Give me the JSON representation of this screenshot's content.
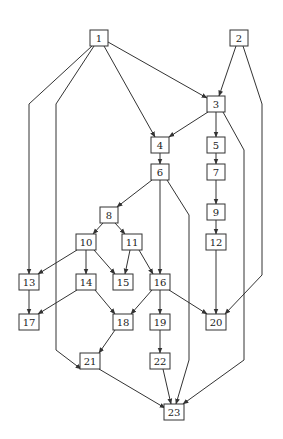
{
  "diagram": {
    "type": "directed-acyclic-graph",
    "colors": {
      "line": "#333333",
      "node_fill": "#ffffff",
      "text": "#222222",
      "background": "#ffffff"
    },
    "node_size": {
      "w": 18,
      "h": 16
    },
    "nodes": [
      {
        "id": "1",
        "label": "1",
        "x": 99,
        "y": 38
      },
      {
        "id": "2",
        "label": "2",
        "x": 239,
        "y": 38
      },
      {
        "id": "3",
        "label": "3",
        "x": 216,
        "y": 104
      },
      {
        "id": "4",
        "label": "4",
        "x": 160,
        "y": 145
      },
      {
        "id": "5",
        "label": "5",
        "x": 216,
        "y": 145
      },
      {
        "id": "6",
        "label": "6",
        "x": 160,
        "y": 172
      },
      {
        "id": "7",
        "label": "7",
        "x": 216,
        "y": 172
      },
      {
        "id": "8",
        "label": "8",
        "x": 109,
        "y": 215
      },
      {
        "id": "9",
        "label": "9",
        "x": 216,
        "y": 212
      },
      {
        "id": "10",
        "label": "10",
        "x": 86,
        "y": 242
      },
      {
        "id": "11",
        "label": "11",
        "x": 132,
        "y": 242
      },
      {
        "id": "12",
        "label": "12",
        "x": 216,
        "y": 242
      },
      {
        "id": "13",
        "label": "13",
        "x": 29,
        "y": 282
      },
      {
        "id": "14",
        "label": "14",
        "x": 86,
        "y": 282
      },
      {
        "id": "15",
        "label": "15",
        "x": 123,
        "y": 282
      },
      {
        "id": "16",
        "label": "16",
        "x": 160,
        "y": 282
      },
      {
        "id": "17",
        "label": "17",
        "x": 29,
        "y": 322
      },
      {
        "id": "18",
        "label": "18",
        "x": 123,
        "y": 322
      },
      {
        "id": "19",
        "label": "19",
        "x": 160,
        "y": 322
      },
      {
        "id": "20",
        "label": "20",
        "x": 216,
        "y": 322
      },
      {
        "id": "21",
        "label": "21",
        "x": 90,
        "y": 361
      },
      {
        "id": "22",
        "label": "22",
        "x": 160,
        "y": 361
      },
      {
        "id": "23",
        "label": "23",
        "x": 174,
        "y": 412
      }
    ],
    "edges": [
      {
        "from": "1",
        "to": "13",
        "points": [
          [
            92,
            46
          ],
          [
            29,
            104
          ],
          [
            29,
            274
          ]
        ]
      },
      {
        "from": "1",
        "to": "21",
        "points": [
          [
            94,
            46
          ],
          [
            56,
            104
          ],
          [
            56,
            350
          ],
          [
            81,
            369
          ]
        ]
      },
      {
        "from": "1",
        "to": "4",
        "points": [
          [
            104,
            46
          ],
          [
            155,
            137
          ]
        ]
      },
      {
        "from": "1",
        "to": "3",
        "points": [
          [
            108,
            42
          ],
          [
            207,
            98
          ]
        ]
      },
      {
        "from": "2",
        "to": "3",
        "points": [
          [
            236,
            46
          ],
          [
            219,
            96
          ]
        ]
      },
      {
        "from": "2",
        "to": "20",
        "points": [
          [
            243,
            46
          ],
          [
            262,
            104
          ],
          [
            262,
            275
          ],
          [
            225,
            314
          ]
        ]
      },
      {
        "from": "3",
        "to": "4",
        "points": [
          [
            208,
            112
          ],
          [
            169,
            137
          ]
        ]
      },
      {
        "from": "3",
        "to": "5",
        "points": [
          [
            216,
            112
          ],
          [
            216,
            137
          ]
        ]
      },
      {
        "from": "3",
        "to": "23",
        "points": [
          [
            223,
            112
          ],
          [
            244,
            150
          ],
          [
            244,
            360
          ],
          [
            183,
            404
          ]
        ]
      },
      {
        "from": "4",
        "to": "6",
        "points": [
          [
            160,
            153
          ],
          [
            160,
            164
          ]
        ]
      },
      {
        "from": "5",
        "to": "7",
        "points": [
          [
            216,
            153
          ],
          [
            216,
            164
          ]
        ]
      },
      {
        "from": "6",
        "to": "8",
        "points": [
          [
            152,
            180
          ],
          [
            117,
            207
          ]
        ]
      },
      {
        "from": "6",
        "to": "16",
        "points": [
          [
            160,
            180
          ],
          [
            160,
            274
          ]
        ]
      },
      {
        "from": "6",
        "to": "23",
        "points": [
          [
            167,
            180
          ],
          [
            189,
            215
          ],
          [
            189,
            360
          ],
          [
            176,
            404
          ]
        ]
      },
      {
        "from": "7",
        "to": "9",
        "points": [
          [
            216,
            180
          ],
          [
            216,
            204
          ]
        ]
      },
      {
        "from": "8",
        "to": "10",
        "points": [
          [
            103,
            223
          ],
          [
            93,
            234
          ]
        ]
      },
      {
        "from": "8",
        "to": "11",
        "points": [
          [
            115,
            223
          ],
          [
            125,
            234
          ]
        ]
      },
      {
        "from": "9",
        "to": "12",
        "points": [
          [
            216,
            220
          ],
          [
            216,
            234
          ]
        ]
      },
      {
        "from": "10",
        "to": "13",
        "points": [
          [
            77,
            250
          ],
          [
            38,
            274
          ]
        ]
      },
      {
        "from": "10",
        "to": "14",
        "points": [
          [
            86,
            250
          ],
          [
            86,
            274
          ]
        ]
      },
      {
        "from": "10",
        "to": "15",
        "points": [
          [
            94,
            250
          ],
          [
            115,
            274
          ]
        ]
      },
      {
        "from": "11",
        "to": "15",
        "points": [
          [
            130,
            250
          ],
          [
            125,
            274
          ]
        ]
      },
      {
        "from": "11",
        "to": "16",
        "points": [
          [
            139,
            250
          ],
          [
            153,
            274
          ]
        ]
      },
      {
        "from": "12",
        "to": "20",
        "points": [
          [
            216,
            250
          ],
          [
            216,
            314
          ]
        ]
      },
      {
        "from": "13",
        "to": "17",
        "points": [
          [
            29,
            290
          ],
          [
            29,
            314
          ]
        ]
      },
      {
        "from": "14",
        "to": "17",
        "points": [
          [
            77,
            290
          ],
          [
            38,
            314
          ]
        ]
      },
      {
        "from": "14",
        "to": "18",
        "points": [
          [
            95,
            290
          ],
          [
            115,
            314
          ]
        ]
      },
      {
        "from": "16",
        "to": "18",
        "points": [
          [
            152,
            290
          ],
          [
            131,
            314
          ]
        ]
      },
      {
        "from": "16",
        "to": "19",
        "points": [
          [
            160,
            290
          ],
          [
            160,
            314
          ]
        ]
      },
      {
        "from": "16",
        "to": "20",
        "points": [
          [
            169,
            290
          ],
          [
            207,
            314
          ]
        ]
      },
      {
        "from": "18",
        "to": "21",
        "points": [
          [
            115,
            330
          ],
          [
            99,
            353
          ]
        ]
      },
      {
        "from": "19",
        "to": "22",
        "points": [
          [
            160,
            330
          ],
          [
            160,
            353
          ]
        ]
      },
      {
        "from": "21",
        "to": "23",
        "points": [
          [
            99,
            369
          ],
          [
            165,
            408
          ]
        ]
      },
      {
        "from": "22",
        "to": "23",
        "points": [
          [
            163,
            369
          ],
          [
            171,
            404
          ]
        ]
      }
    ]
  }
}
